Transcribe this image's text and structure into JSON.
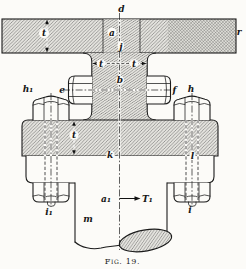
{
  "figure": {
    "caption": "Fig. 19.",
    "labels": {
      "d": "d",
      "r": "r",
      "plate_t": "t",
      "a": "a",
      "j": "j",
      "web_t_left": "t",
      "web_t_right": "t",
      "b": "b",
      "e": "e",
      "f": "f",
      "h1": "h₁",
      "h": "h",
      "flange_t": "t",
      "k": "k",
      "l": "l",
      "i1": "i₁",
      "i": "i",
      "a1": "a₁",
      "T1": "T₁",
      "m": "m"
    },
    "colors": {
      "paper": "#fcfbf8",
      "ink": "#1b1b1b",
      "hatch_line": "#4e4e4e",
      "metal_fill": "#e4e3de"
    }
  }
}
